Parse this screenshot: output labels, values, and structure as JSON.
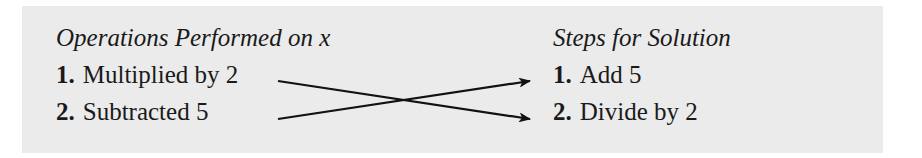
{
  "left_column": {
    "heading": "Operations Performed on x",
    "items": [
      {
        "number": "1.",
        "text": "Multiplied by 2"
      },
      {
        "number": "2.",
        "text": "Subtracted 5"
      }
    ]
  },
  "right_column": {
    "heading": "Steps for Solution",
    "items": [
      {
        "number": "1.",
        "text": "Add 5"
      },
      {
        "number": "2.",
        "text": "Divide by 2"
      }
    ]
  },
  "arrows": [
    {
      "from": "left_column.items.0",
      "to": "right_column.items.1"
    },
    {
      "from": "left_column.items.1",
      "to": "right_column.items.0"
    }
  ],
  "colors": {
    "panel_background": "#ebebeb",
    "text": "#1a1a1a",
    "arrow": "#111111"
  }
}
